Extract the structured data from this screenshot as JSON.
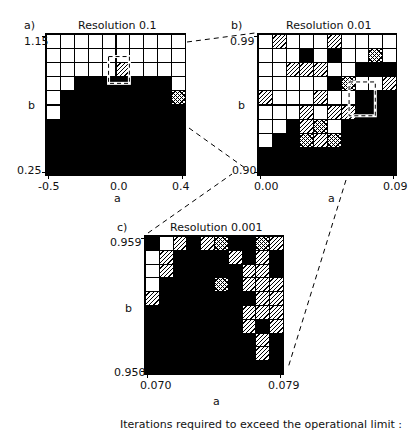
{
  "caption": "Iterations required to exceed the operational limit :",
  "legend_key": {
    "W": "white / few iterations",
    "H": "single hatch",
    "X": "cross hatch",
    "B": "black / limit not exceeded"
  },
  "panels": [
    {
      "id": "a",
      "letter": "a)",
      "title": "Resolution   0.1",
      "xlabel": "a",
      "ylabel": "b",
      "xticks": [
        "-0.5",
        "0.0",
        "0.4"
      ],
      "yticks": [
        "1.15",
        "0.25"
      ],
      "box": {
        "x": 45,
        "y": 33,
        "w": 141,
        "h": 143
      },
      "zoom_box": {
        "col0": 4.5,
        "row0": 1.6,
        "col1": 6.0,
        "row1": 3.5
      },
      "rows": [
        "WWWWWWWWWW",
        "WWWWWWWWWW",
        "WWWWWHWWWW",
        "WWBBBBBBBW",
        "WBBBBBBBBX",
        "WBBBBBBBBB",
        "BBBBBBBBBB",
        "BBBBBBBBBB",
        "BBBBBBBBBB",
        "BBBBBBBBBB"
      ]
    },
    {
      "id": "b",
      "letter": "b)",
      "title": "Resolution   0.01",
      "xlabel": "a",
      "ylabel": "b",
      "xticks": [
        "0.00",
        "0.09"
      ],
      "yticks": [
        "0.99",
        "0.90"
      ],
      "box": {
        "x": 257,
        "y": 33,
        "w": 140,
        "h": 143
      },
      "zoom_box": {
        "col0": 6.6,
        "row0": 3.4,
        "col1": 8.5,
        "row1": 5.8
      },
      "rows": [
        "WHWWWHWWWW",
        "WWWBWBWWXW",
        "WWHHHWWBBB",
        "WWWWWBXWWH",
        "HWWWHWWBBB",
        "WWWHWHHBBB",
        "WWBHXWBBBB",
        "WBBXHXBBBB",
        "BBBBBBBBBB",
        "BBBBBBBBBB"
      ]
    },
    {
      "id": "c",
      "letter": "c)",
      "title": "Resolution   0.001",
      "xlabel": "a",
      "ylabel": "b",
      "xticks": [
        "0.070",
        "0.079"
      ],
      "yticks": [
        "0.959",
        "0.950"
      ],
      "box": {
        "x": 144,
        "y": 235,
        "w": 140,
        "h": 140
      },
      "rows": [
        "BWHBHXBBXH",
        "WHBBBBHBHB",
        "WHBBBBBHHB",
        "WBBBBXBHHH",
        "HBBBBBBBHH",
        "BBBBBBBHHH",
        "BBBBBBBHBH",
        "BBBBBBBBHB",
        "BBBBBBBBHB",
        "BBBBBBBBBB"
      ]
    }
  ],
  "connector_lines": [
    {
      "from": [
        187,
        42
      ],
      "to": [
        255,
        33
      ]
    },
    {
      "from": [
        189,
        128
      ],
      "to": [
        245,
        168
      ]
    },
    {
      "from": [
        148,
        233
      ],
      "to": [
        232,
        174
      ]
    },
    {
      "from": [
        346,
        180
      ],
      "to": [
        288,
        368
      ]
    }
  ],
  "colors": {
    "ink": "#000000",
    "paper": "#ffffff"
  }
}
